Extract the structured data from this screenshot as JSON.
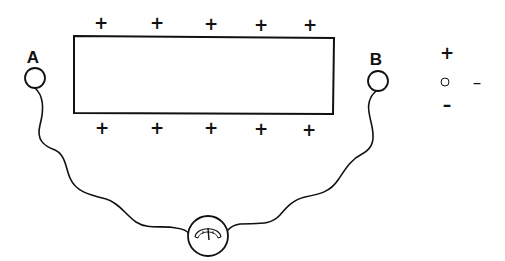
{
  "diagram": {
    "labels": {
      "a": "A",
      "b": "B"
    },
    "plate": {
      "top_charges": [
        "+",
        "+",
        "+",
        "+",
        "+"
      ],
      "bottom_charges": [
        "+",
        "+",
        "+",
        "+",
        "+"
      ]
    },
    "legend": {
      "plus": "+",
      "neutral_dash": "–",
      "minus": "–"
    },
    "colors": {
      "stroke": "#111111",
      "background": "#ffffff"
    },
    "icons": {
      "meter": "galvanometer-icon",
      "terminal_a": "electrode-circle-icon",
      "terminal_b": "electrode-circle-icon",
      "legend_circle": "neutral-circle-icon"
    }
  }
}
